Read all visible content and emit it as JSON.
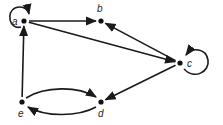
{
  "diagram": {
    "type": "directed-graph",
    "nodes": [
      {
        "id": "a",
        "label": "a"
      },
      {
        "id": "b",
        "label": "b"
      },
      {
        "id": "c",
        "label": "c"
      },
      {
        "id": "d",
        "label": "d"
      },
      {
        "id": "e",
        "label": "e"
      }
    ],
    "edges": [
      {
        "from": "a",
        "to": "a",
        "kind": "loop"
      },
      {
        "from": "a",
        "to": "b"
      },
      {
        "from": "a",
        "to": "c"
      },
      {
        "from": "c",
        "to": "b"
      },
      {
        "from": "c",
        "to": "c",
        "kind": "loop"
      },
      {
        "from": "c",
        "to": "d"
      },
      {
        "from": "e",
        "to": "a"
      },
      {
        "from": "e",
        "to": "d",
        "kind": "curved"
      },
      {
        "from": "d",
        "to": "e",
        "kind": "curved"
      }
    ],
    "colors": {
      "stroke": "#1a1a1a",
      "background": "#ffffff"
    }
  }
}
